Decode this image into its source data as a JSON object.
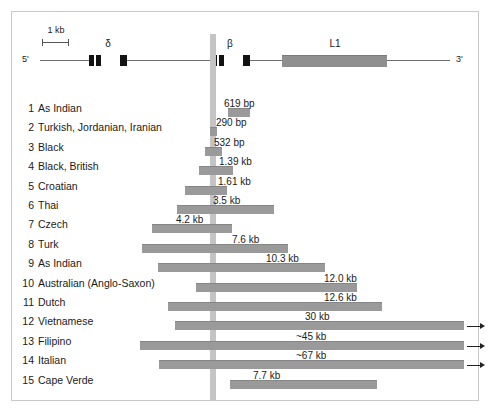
{
  "figure": {
    "scale": {
      "label": "1 kb"
    },
    "gene_map": {
      "five_prime": "5'",
      "three_prime": "3'",
      "features": [
        {
          "name": "delta",
          "label": "δ",
          "type": "gene"
        },
        {
          "name": "beta",
          "label": "β",
          "type": "gene"
        },
        {
          "name": "l1",
          "label": "L1",
          "type": "repeat-element"
        }
      ]
    },
    "rows": [
      {
        "num": "1",
        "label": "As Indian",
        "value": "619 bp",
        "arrow": false
      },
      {
        "num": "2",
        "label": "Turkish, Jordanian, Iranian",
        "value": "290 bp",
        "arrow": false
      },
      {
        "num": "3",
        "label": "Black",
        "value": "532 bp",
        "arrow": false
      },
      {
        "num": "4",
        "label": "Black, British",
        "value": "1.39 kb",
        "arrow": false
      },
      {
        "num": "5",
        "label": "Croatian",
        "value": "1.61 kb",
        "arrow": false
      },
      {
        "num": "6",
        "label": "Thai",
        "value": "3.5 kb",
        "arrow": false
      },
      {
        "num": "7",
        "label": "Czech",
        "value": "4.2 kb",
        "arrow": false
      },
      {
        "num": "8",
        "label": "Turk",
        "value": "7.6 kb",
        "arrow": false
      },
      {
        "num": "9",
        "label": "As Indian",
        "value": "10.3 kb",
        "arrow": false
      },
      {
        "num": "10",
        "label": "Australian (Anglo-Saxon)",
        "value": "12.0 kb",
        "arrow": false
      },
      {
        "num": "11",
        "label": "Dutch",
        "value": "12.6 kb",
        "arrow": false
      },
      {
        "num": "12",
        "label": "Vietnamese",
        "value": "30 kb",
        "arrow": true
      },
      {
        "num": "13",
        "label": "Filipino",
        "value": "~45 kb",
        "arrow": true
      },
      {
        "num": "14",
        "label": "Italian",
        "value": "~67 kb",
        "arrow": true
      },
      {
        "num": "15",
        "label": "Cape Verde",
        "value": "7.7 kb",
        "arrow": false
      }
    ]
  },
  "chart_data": {
    "type": "bar",
    "title": "",
    "xlabel": "",
    "ylabel": "",
    "orientation": "horizontal",
    "note": "Deletion extents on the beta-globin gene cluster, aligned to a common reference breakpoint (vertical grey line at the beta gene).",
    "categories": [
      "As Indian",
      "Turkish, Jordanian, Iranian",
      "Black",
      "Black, British",
      "Croatian",
      "Thai",
      "Czech",
      "Turk",
      "As Indian",
      "Australian (Anglo-Saxon)",
      "Dutch",
      "Vietnamese",
      "Filipino",
      "Italian",
      "Cape Verde"
    ],
    "value_labels": [
      "619 bp",
      "290 bp",
      "532 bp",
      "1.39 kb",
      "1.61 kb",
      "3.5 kb",
      "4.2 kb",
      "7.6 kb",
      "10.3 kb",
      "12.0 kb",
      "12.6 kb",
      "30 kb",
      "~45 kb",
      "~67 kb",
      "7.7 kb"
    ],
    "values_kb": [
      0.619,
      0.29,
      0.532,
      1.39,
      1.61,
      3.5,
      4.2,
      7.6,
      10.3,
      12.0,
      12.6,
      30,
      45,
      67,
      7.7
    ],
    "open_ended": [
      false,
      false,
      false,
      false,
      false,
      false,
      false,
      false,
      false,
      false,
      false,
      true,
      true,
      true,
      false
    ],
    "grid": false,
    "legend": "none"
  }
}
